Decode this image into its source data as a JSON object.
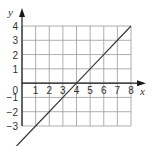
{
  "chart_data": {
    "type": "line",
    "title": "",
    "xlabel": "x",
    "ylabel": "y",
    "xlim": [
      0,
      8
    ],
    "ylim": [
      -3,
      4
    ],
    "grid": true,
    "x_ticks": [
      "1",
      "2",
      "3",
      "4",
      "5",
      "6",
      "7",
      "8"
    ],
    "y_ticks": [
      "4",
      "3",
      "2",
      "1",
      "0",
      "−1",
      "−2",
      "−3"
    ],
    "origin_label": "0",
    "series": [
      {
        "name": "y = x − 4",
        "x": [
          -0.6,
          0,
          1,
          2,
          3,
          4,
          5,
          6,
          7,
          8
        ],
        "y": [
          -4.6,
          -4,
          -3,
          -2,
          -1,
          0,
          1,
          2,
          3,
          4
        ]
      }
    ],
    "colors": {
      "line": "#3a3a3a",
      "grid": "#9a9a9a",
      "axis": "#1a1a1a",
      "text": "#333333"
    }
  }
}
